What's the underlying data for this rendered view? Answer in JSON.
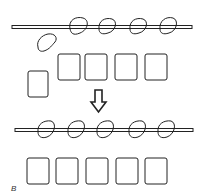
{
  "diagram": {
    "panel_label": "B",
    "stroke_color": "#222222",
    "top_stage": {
      "bar": {
        "x1": 12,
        "x2": 192,
        "y": 27
      },
      "attached_blobs": 4,
      "loose_blobs": 1,
      "aligned_squares": 4,
      "offset_squares": 1
    },
    "arrow": {
      "direction": "down"
    },
    "bottom_stage": {
      "bar": {
        "x1": 15,
        "x2": 193,
        "y": 130
      },
      "attached_blobs": 5,
      "aligned_squares": 5
    }
  }
}
